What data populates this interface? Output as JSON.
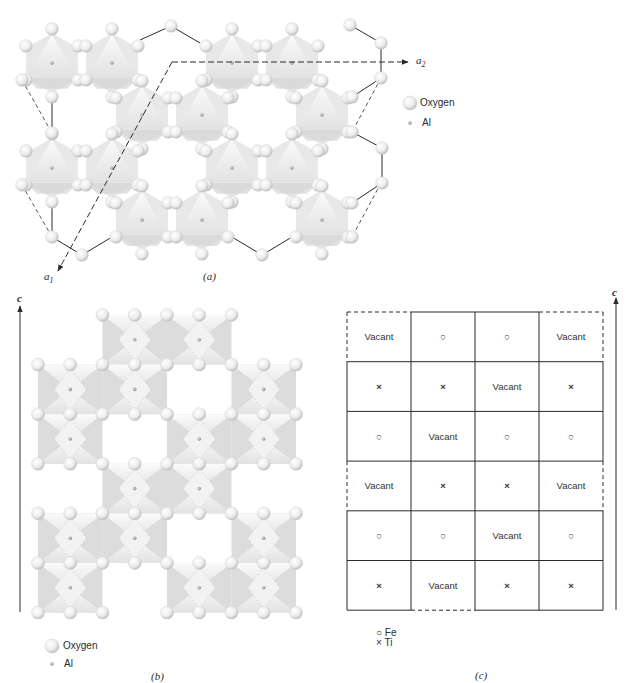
{
  "colors": {
    "ink": "#2a2a2a",
    "oxygen_light": "#ffffff",
    "oxygen_dark": "#bdbdbd",
    "polyhedron_light": "#f4f4f4",
    "polyhedron_shade": "#d6d6d6",
    "al_dot": "#9a9a9a"
  },
  "panel_a": {
    "caption": "(a)",
    "axis_a1_label": "a",
    "axis_a1_sub": "1",
    "axis_a2_label": "a",
    "axis_a2_sub": "2",
    "legend": {
      "oxygen_label": "Oxygen",
      "al_label": "Al"
    },
    "octahedra_centers": [
      [
        52,
        63
      ],
      [
        112,
        63
      ],
      [
        232,
        63
      ],
      [
        292,
        63
      ],
      [
        142,
        115
      ],
      [
        202,
        115
      ],
      [
        322,
        115
      ],
      [
        52,
        168
      ],
      [
        112,
        168
      ],
      [
        232,
        168
      ],
      [
        292,
        168
      ],
      [
        142,
        220
      ],
      [
        202,
        220
      ],
      [
        322,
        220
      ]
    ],
    "octahedron_radius": 30,
    "boundary_solid": [
      [
        [
          140,
          40
        ],
        [
          171,
          26
        ],
        [
          200,
          43
        ]
      ],
      [
        [
          350,
          25
        ],
        [
          381,
          43
        ],
        [
          381,
          78
        ],
        [
          352,
          97
        ]
      ],
      [
        [
          52,
          99
        ],
        [
          52,
          133
        ]
      ],
      [
        [
          352,
          132
        ],
        [
          382,
          148
        ],
        [
          382,
          183
        ],
        [
          352,
          203
        ]
      ],
      [
        [
          52,
          203
        ],
        [
          52,
          237
        ],
        [
          82,
          255
        ],
        [
          112,
          237
        ]
      ],
      [
        [
          232,
          237
        ],
        [
          262,
          255
        ],
        [
          292,
          237
        ]
      ]
    ],
    "boundary_dashed": [
      [
        [
          22,
          80
        ],
        [
          52,
          133
        ]
      ],
      [
        [
          381,
          78
        ],
        [
          352,
          132
        ]
      ],
      [
        [
          22,
          185
        ],
        [
          52,
          237
        ]
      ],
      [
        [
          381,
          183
        ],
        [
          352,
          237
        ]
      ]
    ],
    "unit_cell": {
      "origin": [
        172,
        62
      ],
      "a2_end": [
        408,
        62
      ],
      "a1_end": [
        58,
        271
      ]
    }
  },
  "panel_b": {
    "caption": "(b)",
    "axis_label": "c",
    "legend": {
      "oxygen_label": "Oxygen",
      "al_label": "Al"
    },
    "grid": {
      "x0": 38,
      "y0": 315,
      "col_w": 64.5,
      "row_h": 49.6,
      "cols": 4,
      "rows": 6
    },
    "occupied": [
      [
        1,
        2
      ],
      [
        0,
        1,
        3
      ],
      [
        0,
        2,
        3
      ],
      [
        1,
        2
      ],
      [
        0,
        1,
        3
      ],
      [
        0,
        2,
        3
      ]
    ]
  },
  "panel_c": {
    "caption": "(c)",
    "axis_label": "c",
    "legend": {
      "fe_symbol": "○",
      "fe_label": "Fe",
      "ti_symbol": "×",
      "ti_label": "Ti"
    },
    "grid": {
      "x0": 347,
      "y0": 312,
      "col_w": 64,
      "row_h": 49.7
    },
    "rows": [
      [
        "Vacant",
        "○",
        "○",
        "Vacant"
      ],
      [
        "×",
        "×",
        "Vacant",
        "×"
      ],
      [
        "○",
        "Vacant",
        "○",
        "○"
      ],
      [
        "Vacant",
        "×",
        "×",
        "Vacant"
      ],
      [
        "○",
        "○",
        "Vacant",
        "○"
      ],
      [
        "×",
        "Vacant",
        "×",
        "×"
      ]
    ],
    "dashed_edges": {
      "left_rows": [
        0,
        3
      ],
      "right_rows": [
        0,
        3
      ],
      "top_cols": [
        0,
        3
      ],
      "bottom_cols": [
        1
      ]
    }
  }
}
